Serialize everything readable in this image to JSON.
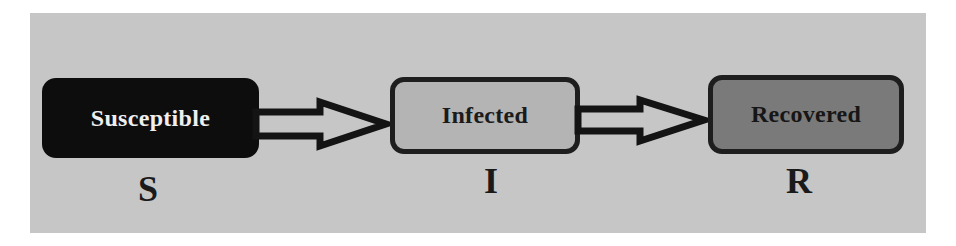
{
  "diagram": {
    "type": "SIR compartmental model flow",
    "background_color": "#c6c6c6",
    "nodes": [
      {
        "id": "S",
        "label": "Susceptible",
        "symbol": "S",
        "fill": "#0d0d0d",
        "text_color": "#efefef"
      },
      {
        "id": "I",
        "label": "Infected",
        "symbol": "I",
        "fill": "#b4b4b4",
        "text_color": "#1b1b1b"
      },
      {
        "id": "R",
        "label": "Recovered",
        "symbol": "R",
        "fill": "#7a7a7a",
        "text_color": "#161616"
      }
    ],
    "edges": [
      {
        "from": "S",
        "to": "I",
        "style": "hollow-double-line-arrow"
      },
      {
        "from": "I",
        "to": "R",
        "style": "hollow-double-line-arrow"
      }
    ]
  }
}
